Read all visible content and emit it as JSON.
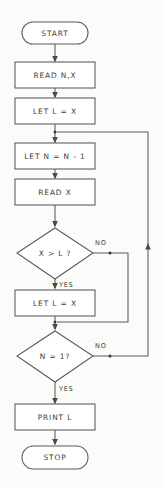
{
  "diagram": {
    "type": "flowchart",
    "nodes": [
      {
        "id": "start",
        "shape": "terminator",
        "label": "START"
      },
      {
        "id": "read_nx",
        "shape": "process",
        "label": "READ N,X"
      },
      {
        "id": "let_l_x_1",
        "shape": "process",
        "label": "LET L = X"
      },
      {
        "id": "let_n",
        "shape": "process",
        "label": "LET N = N - 1"
      },
      {
        "id": "read_x",
        "shape": "process",
        "label": "READ X"
      },
      {
        "id": "test_x_l",
        "shape": "decision",
        "label": "X > L ?"
      },
      {
        "id": "let_l_x_2",
        "shape": "process",
        "label": "LET L = X"
      },
      {
        "id": "test_n_1",
        "shape": "decision",
        "label": "N = 1?"
      },
      {
        "id": "print_l",
        "shape": "process",
        "label": "PRINT L"
      },
      {
        "id": "stop",
        "shape": "terminator",
        "label": "STOP"
      }
    ],
    "branch_labels": {
      "x_gt_l_no": "NO",
      "x_gt_l_yes": "YES",
      "n_eq_1_no": "NO",
      "n_eq_1_yes": "YES"
    },
    "colors": {
      "background": "#fbfbf9",
      "stroke": "#5a5a5a",
      "text": "#3a3a3a",
      "fill": "#ffffff"
    }
  }
}
